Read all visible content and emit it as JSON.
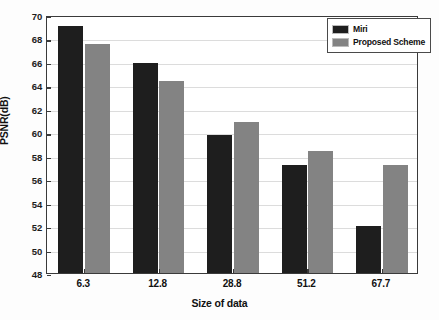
{
  "chart_data": {
    "type": "bar",
    "title": "",
    "xlabel": "Size of data",
    "ylabel": "PSNR(dB)",
    "categories": [
      "6.3",
      "12.8",
      "28.8",
      "51.2",
      "67.7"
    ],
    "series": [
      {
        "name": "Miri",
        "color": "#1e1e1e",
        "values": [
          69.1,
          65.9,
          59.8,
          57.2,
          52.0
        ]
      },
      {
        "name": "Proposed Scheme",
        "color": "#838383",
        "values": [
          67.5,
          64.4,
          60.9,
          58.4,
          57.2
        ]
      }
    ],
    "ylim": [
      48,
      70
    ],
    "ytick_step": 2,
    "yticks": [
      48,
      50,
      52,
      54,
      56,
      58,
      60,
      62,
      64,
      66,
      68,
      70
    ],
    "ytick_labels": [
      "48",
      "50",
      "52",
      "54",
      "56",
      "58",
      "60",
      "62",
      "64",
      "66",
      "68",
      "70"
    ],
    "grid": true,
    "grid_axis": "y",
    "legend_position": "top-right",
    "legend_entries": [
      "Miri",
      "Proposed Scheme"
    ]
  }
}
